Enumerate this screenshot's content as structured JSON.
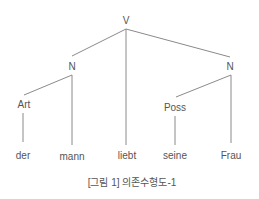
{
  "diagram": {
    "type": "dependency-tree",
    "nodes": {
      "root": "V",
      "left_noun": "N",
      "right_noun": "N",
      "article": "Art",
      "possessive": "Poss"
    },
    "words": [
      "der",
      "mann",
      "liebt",
      "seine",
      "Frau"
    ],
    "edges": [
      [
        "V",
        "N (left)"
      ],
      [
        "V",
        "liebt"
      ],
      [
        "V",
        "N (right)"
      ],
      [
        "N (left)",
        "Art"
      ],
      [
        "N (left)",
        "mann"
      ],
      [
        "Art",
        "der"
      ],
      [
        "N (right)",
        "Poss"
      ],
      [
        "N (right)",
        "Frau"
      ],
      [
        "Poss",
        "seine"
      ]
    ],
    "line_color": "#777777",
    "text_color": "#555555"
  },
  "caption": "[그림 1] 의존수형도-1"
}
